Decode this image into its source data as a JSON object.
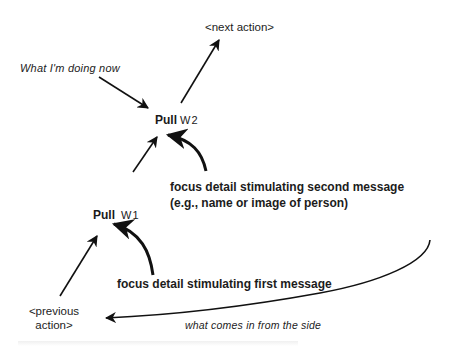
{
  "diagram": {
    "labels": {
      "next_action": "<next action>",
      "what_doing_now": "What I'm doing now",
      "pull_w2": {
        "main": "Pull",
        "sub": "W2"
      },
      "pull_w1": {
        "main": "Pull",
        "sub": "W1"
      },
      "focus_second_line1": "focus detail stimulating second message",
      "focus_second_line2": "(e.g., name or image of person)",
      "focus_first": "focus detail stimulating first message",
      "previous_action_line1": "<previous",
      "previous_action_line2": "action>",
      "from_side": "what comes in from the side"
    },
    "colors": {
      "ink": "#1a1a1a",
      "background": "#ffffff"
    }
  }
}
